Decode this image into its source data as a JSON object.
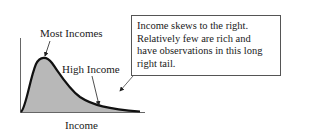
{
  "diagram": {
    "labels": {
      "peak": "Most Incomes",
      "tail": "High Income",
      "x_axis": "Income"
    },
    "note": {
      "lines": [
        "Income skews to the right.",
        "Relatively few are rich and",
        "have observations in this long",
        "right tail."
      ]
    },
    "colors": {
      "fill": "#b8b8b8",
      "curve": "#111111",
      "axis": "#555555",
      "box_border": "#555555"
    }
  }
}
